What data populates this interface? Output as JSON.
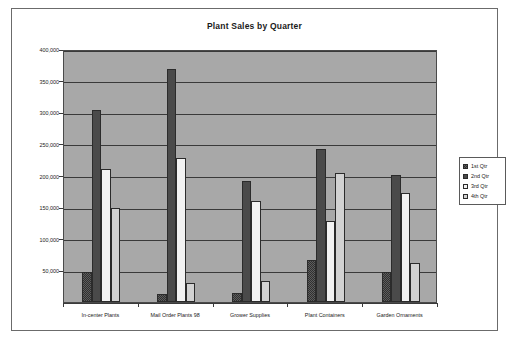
{
  "chart_data": {
    "type": "bar",
    "title": "Plant Sales by Quarter",
    "xlabel": "",
    "ylabel": "",
    "ylim": [
      0,
      400000
    ],
    "ytick_values": [
      0,
      50000,
      100000,
      150000,
      200000,
      250000,
      300000,
      350000,
      400000
    ],
    "ytick_labels": [
      "0",
      "50,000",
      "100,000",
      "150,000",
      "200,000",
      "250,000",
      "300,000",
      "350,000",
      "400,000"
    ],
    "grid": true,
    "legend_position": "right",
    "categories": [
      "In-center Plants",
      "Mail Order Plants 98",
      "Grower Supplies",
      "Plant Containers",
      "Garden Ornaments"
    ],
    "series": [
      {
        "name": "1st Qtr",
        "values": [
          48000,
          12000,
          15000,
          67000,
          48000
        ],
        "fill": "#5d5d5d"
      },
      {
        "name": "2nd Qtr",
        "values": [
          304000,
          368000,
          192000,
          242000,
          201000
        ],
        "fill": "#4a4a4a"
      },
      {
        "name": "3rd Qtr",
        "values": [
          211000,
          228000,
          159000,
          128000,
          172000
        ],
        "fill": "#f2f2f2"
      },
      {
        "name": "4th Qtr",
        "values": [
          148000,
          30000,
          33000,
          204000,
          61000
        ],
        "fill": "#d2d2d2"
      }
    ]
  },
  "legend": {
    "items": [
      {
        "label": "1st Qtr"
      },
      {
        "label": "2nd Qtr"
      },
      {
        "label": "3rd Qtr"
      },
      {
        "label": "4th Qtr"
      }
    ]
  },
  "colors": {
    "plot_background": "#a8a8a8",
    "gridline": "#3a3a3a",
    "frame_border": "#6b6b6b",
    "text": "#1a1a1a"
  }
}
